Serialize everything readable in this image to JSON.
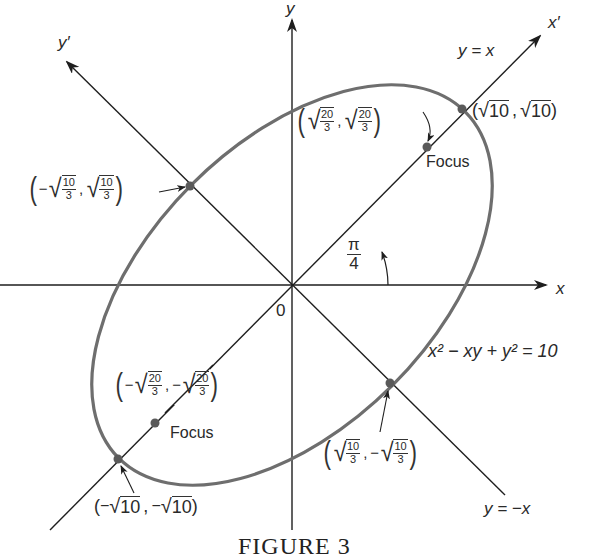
{
  "figure": {
    "caption": "FIGURE 3",
    "equation": "x² − xy + y² = 10",
    "angle_label": {
      "num": "π",
      "den": "4"
    },
    "axes": {
      "x_label": "x",
      "y_label": "y",
      "x_prime_label": "x′",
      "y_prime_label": "y′",
      "origin_label": "0",
      "line_y_eq_x": "y = x",
      "line_y_eq_neg_x": "y = −x"
    },
    "points": {
      "vertex_pos": {
        "text": "(√10 , √10)",
        "a": "10",
        "b": "10"
      },
      "vertex_neg": {
        "text": "(−√10 , −√10)",
        "a": "10",
        "b": "10"
      },
      "covertex_upper_left": {
        "text": "(−√(10/3), √(10/3))",
        "num": "10",
        "den": "3"
      },
      "covertex_lower_right": {
        "text": "(√(10/3), −√(10/3))",
        "num": "10",
        "den": "3"
      },
      "focus_pos": {
        "label": "Focus",
        "text": "(√(20/3), √(20/3))",
        "num": "20",
        "den": "3"
      },
      "focus_neg": {
        "label": "Focus",
        "text": "(−√(20/3), −√(20/3))",
        "num": "20",
        "den": "3"
      }
    },
    "colors": {
      "ellipse": "#6e6e6e",
      "axis": "#1e1e1e",
      "point": "#5a5a5a",
      "text": "#2a2a2a"
    },
    "geometry": {
      "origin_px": [
        292,
        285
      ],
      "ellipse_semi_major_px": 245,
      "ellipse_semi_minor_px": 142,
      "rotation_deg": -45
    }
  }
}
